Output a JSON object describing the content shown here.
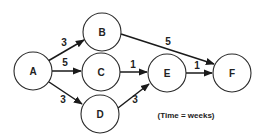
{
  "diagram": {
    "type": "network-activity-diagram",
    "nodes": [
      {
        "id": "A",
        "label": "A",
        "cx": 33,
        "cy": 71
      },
      {
        "id": "B",
        "label": "B",
        "cx": 102,
        "cy": 32
      },
      {
        "id": "C",
        "label": "C",
        "cx": 101,
        "cy": 72
      },
      {
        "id": "D",
        "label": "D",
        "cx": 100,
        "cy": 114
      },
      {
        "id": "E",
        "label": "E",
        "cx": 167,
        "cy": 73
      },
      {
        "id": "F",
        "label": "F",
        "cx": 232,
        "cy": 73
      }
    ],
    "edges": [
      {
        "from": "A",
        "to": "B",
        "weight": "3"
      },
      {
        "from": "A",
        "to": "C",
        "weight": "5"
      },
      {
        "from": "A",
        "to": "D",
        "weight": "3"
      },
      {
        "from": "B",
        "to": "F",
        "weight": "5"
      },
      {
        "from": "C",
        "to": "E",
        "weight": "1"
      },
      {
        "from": "D",
        "to": "E",
        "weight": "3"
      },
      {
        "from": "E",
        "to": "F",
        "weight": "1"
      }
    ],
    "caption": "(Time = weeks)"
  }
}
